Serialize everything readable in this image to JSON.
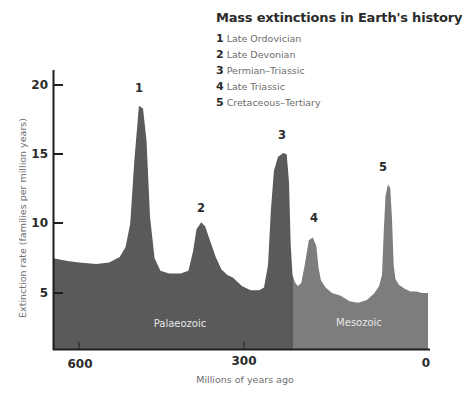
{
  "chart_data": {
    "type": "area",
    "title": "Mass extinctions in Earth's history",
    "xlabel": "Millions of years ago",
    "ylabel": "Extinction rate (families per million years)",
    "x_ticks": [
      600,
      300,
      0
    ],
    "y_ticks": [
      5,
      10,
      15,
      20
    ],
    "xlim": [
      644,
      0
    ],
    "ylim": [
      0.5,
      21
    ],
    "grid": false,
    "legend_position": "top-right",
    "legend": [
      {
        "num": "1",
        "label": "Late Ordovician"
      },
      {
        "num": "2",
        "label": "Late Devonian"
      },
      {
        "num": "3",
        "label": "Permian-Triassic"
      },
      {
        "num": "4",
        "label": "Late Triassic"
      },
      {
        "num": "5",
        "label": "Cretaceous-Tertiary"
      }
    ],
    "eras": [
      {
        "name": "Palaeozoic",
        "from": 644,
        "to": 232,
        "color": "#5a5a5a"
      },
      {
        "name": "Mesozoic",
        "from": 232,
        "to": 0,
        "color": "#7d7d7d"
      }
    ],
    "peaks": [
      {
        "label": "1",
        "x": 497,
        "y": 18.5
      },
      {
        "label": "2",
        "x": 390,
        "y": 10.1
      },
      {
        "label": "3",
        "x": 249,
        "y": 15.1
      },
      {
        "label": "4",
        "x": 198,
        "y": 9.0
      },
      {
        "label": "5",
        "x": 69,
        "y": 12.8
      }
    ],
    "series": [
      {
        "name": "Extinction rate",
        "x": [
          644,
          620,
          600,
          570,
          548,
          530,
          520,
          512,
          505,
          497,
          490,
          484,
          478,
          470,
          460,
          445,
          425,
          412,
          404,
          398,
          390,
          383,
          375,
          365,
          355,
          345,
          335,
          320,
          305,
          290,
          282,
          275,
          270,
          265,
          258,
          249,
          243,
          239,
          236,
          233,
          229,
          224,
          218,
          212,
          205,
          198,
          192,
          188,
          184,
          176,
          165,
          150,
          135,
          120,
          105,
          92,
          84,
          79,
          76,
          73,
          69,
          65,
          62,
          59,
          56,
          50,
          40,
          30,
          20,
          10,
          0
        ],
        "y": [
          7.5,
          7.3,
          7.2,
          7.1,
          7.2,
          7.6,
          8.3,
          10.0,
          14.5,
          18.5,
          18.3,
          16.0,
          10.5,
          7.5,
          6.6,
          6.4,
          6.4,
          6.6,
          8.0,
          9.6,
          10.1,
          9.8,
          8.8,
          7.6,
          6.7,
          6.3,
          6.1,
          5.5,
          5.2,
          5.2,
          5.4,
          7.0,
          11.0,
          13.8,
          14.8,
          15.1,
          15.0,
          13.0,
          8.5,
          6.3,
          5.8,
          5.5,
          5.7,
          7.0,
          8.8,
          9.0,
          8.4,
          6.8,
          5.9,
          5.4,
          5.0,
          4.8,
          4.4,
          4.3,
          4.5,
          5.0,
          5.5,
          6.3,
          9.5,
          12.0,
          12.8,
          12.6,
          10.5,
          7.0,
          6.0,
          5.6,
          5.3,
          5.1,
          5.1,
          5.0,
          5.0
        ]
      }
    ]
  },
  "axes": {
    "y_tick_labels": [
      "20",
      "15",
      "10",
      "5"
    ],
    "x_tick_labels": [
      "600",
      "300",
      "0"
    ],
    "ylabel": "Extinction rate (families per million years)",
    "xlabel": "Millions of years ago"
  },
  "peak_labels": [
    "1",
    "2",
    "3",
    "4",
    "5"
  ],
  "era_labels": {
    "palaeozoic": "Palaeozoic",
    "mesozoic": "Mesozoic"
  },
  "legend": {
    "title": "Mass extinctions in Earth's history",
    "items": [
      {
        "num": "1",
        "label": "Late Ordovician"
      },
      {
        "num": "2",
        "label": "Late Devonian"
      },
      {
        "num": "3",
        "label": "Permian–Triassic"
      },
      {
        "num": "4",
        "label": "Late Triassic"
      },
      {
        "num": "5",
        "label": "Cretaceous–Tertiary"
      }
    ]
  },
  "colors": {
    "palaeozoic": "#5a5a5a",
    "mesozoic": "#7d7d7d",
    "axis": "#1e1e1e",
    "text_dark": "#2b2b2b",
    "text_muted": "#6d6d6d"
  }
}
